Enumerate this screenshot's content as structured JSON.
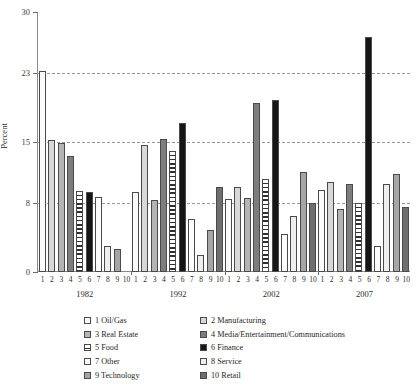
{
  "chart_data": {
    "type": "bar",
    "title": "",
    "xlabel": "",
    "ylabel": "Percent",
    "ylim": [
      0,
      30
    ],
    "yticks": [
      0,
      8,
      15,
      23,
      30
    ],
    "grid": "horizontal dashed at 8, 15, 23",
    "legend_position": "bottom",
    "categories": [
      "1982",
      "1992",
      "2002",
      "2007"
    ],
    "item_labels": [
      "1",
      "2",
      "3",
      "4",
      "5",
      "6",
      "7",
      "8",
      "9",
      "10"
    ],
    "series": [
      {
        "name": "1 Oil/Gas",
        "values": [
          23.2,
          9.2,
          8.4,
          9.5
        ]
      },
      {
        "name": "2 Manufacturing",
        "values": [
          15.2,
          14.7,
          9.8,
          10.4
        ]
      },
      {
        "name": "3 Real Estate",
        "values": [
          14.9,
          8.3,
          8.5,
          7.3
        ]
      },
      {
        "name": "4 Media/Entertainment/Communications",
        "values": [
          13.4,
          15.3,
          19.5,
          10.2
        ]
      },
      {
        "name": "5 Food",
        "values": [
          9.3,
          14.0,
          10.7,
          8.0
        ]
      },
      {
        "name": "6 Finance",
        "values": [
          9.2,
          17.2,
          19.8,
          27.1
        ]
      },
      {
        "name": "7 Other",
        "values": [
          8.6,
          6.1,
          4.4,
          3.0
        ]
      },
      {
        "name": "8 Service",
        "values": [
          3.0,
          2.0,
          6.5,
          10.1
        ]
      },
      {
        "name": "9 Technology",
        "values": [
          2.7,
          4.8,
          11.5,
          11.3
        ]
      },
      {
        "name": "10 Retail",
        "values": [
          0.0,
          9.8,
          8.0,
          7.5
        ]
      }
    ]
  },
  "legend": {
    "items": [
      {
        "label": "1 Oil/Gas",
        "swatch": "s1",
        "color": "#fbfbfb"
      },
      {
        "label": "2 Manufacturing",
        "swatch": "s2",
        "color": "#d8d8d8"
      },
      {
        "label": "3 Real Estate",
        "swatch": "s3",
        "color": "#b4b4b4"
      },
      {
        "label": "4 Media/Entertainment/Communications",
        "swatch": "s4",
        "color": "#7d7d7d"
      },
      {
        "label": "5 Food",
        "swatch": "s5",
        "color": "#303030"
      },
      {
        "label": "6 Finance",
        "swatch": "s6",
        "color": "#161616"
      },
      {
        "label": "7 Other",
        "swatch": "s7",
        "color": "#fdfdfd"
      },
      {
        "label": "8 Service",
        "swatch": "s8",
        "color": "#eeeeee"
      },
      {
        "label": "9 Technology",
        "swatch": "s9",
        "color": "#a6a6a6"
      },
      {
        "label": "10 Retail",
        "swatch": "s10",
        "color": "#6f6f6f"
      }
    ]
  },
  "axes": {
    "y_tick_labels": [
      "30",
      "23",
      "15",
      "8",
      "0"
    ],
    "y_axis_title": "Percent"
  }
}
